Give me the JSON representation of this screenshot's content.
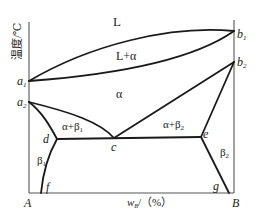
{
  "diagram": {
    "type": "binary phase diagram",
    "y_axis_label": "温度/℃",
    "x_axis_label_main": "w",
    "x_axis_label_sub": "B",
    "x_axis_label_unit": "/（%）",
    "corner_left": "A",
    "corner_right": "B",
    "points": {
      "a1": {
        "label": "a",
        "sub": "1"
      },
      "a2": {
        "label": "a",
        "sub": "2"
      },
      "b1": {
        "label": "b",
        "sub": "1"
      },
      "b2": {
        "label": "b",
        "sub": "2"
      },
      "c": {
        "label": "c"
      },
      "d": {
        "label": "d"
      },
      "e": {
        "label": "e"
      },
      "f": {
        "label": "f"
      },
      "g": {
        "label": "g"
      }
    },
    "regions": {
      "liquid": "L",
      "liquid_alpha": "L+α",
      "alpha": "α",
      "alpha_beta1": "α+β",
      "alpha_beta1_sub": "1",
      "alpha_beta2": "α+β",
      "alpha_beta2_sub": "2",
      "beta1": "β",
      "beta1_sub": "1",
      "beta2": "β",
      "beta2_sub": "2"
    },
    "line_color": "#1a1a1a",
    "axis_color": "#555555"
  }
}
